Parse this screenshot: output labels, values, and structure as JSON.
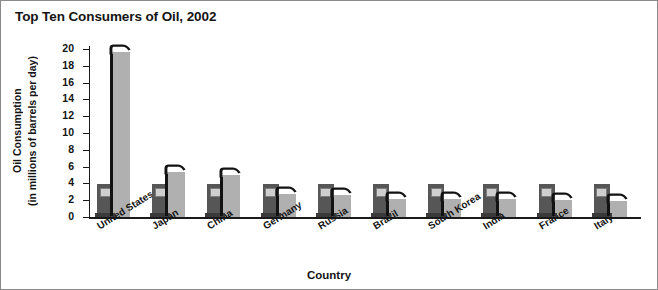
{
  "chart_data": {
    "type": "bar",
    "title": "Top Ten Consumers of Oil, 2002",
    "xlabel": "Country",
    "ylabel": "Oil Consumption (in millions of barrels per day)",
    "ylabel_line1": "Oil Consumption",
    "ylabel_line2": "(in millions of barrels per day)",
    "categories": [
      "United States",
      "Japan",
      "China",
      "Germany",
      "Russia",
      "Brazil",
      "South Korea",
      "India",
      "France",
      "Italy"
    ],
    "values": [
      19.7,
      5.3,
      5.0,
      2.7,
      2.6,
      2.2,
      2.1,
      2.1,
      2.0,
      1.9
    ],
    "ylim": [
      0,
      20
    ],
    "ytick_labels": [
      "0",
      "2",
      "4",
      "6",
      "8",
      "10",
      "12",
      "14",
      "16",
      "18",
      "20"
    ],
    "ytick_values": [
      0,
      2,
      4,
      6,
      8,
      10,
      12,
      14,
      16,
      18,
      20
    ],
    "grid": false,
    "legend": "none",
    "series_name": "Oil consumption",
    "marker_style": "gas-pump",
    "colors": {
      "bar_fill": "#b0b0b0",
      "pump_body": "#565656",
      "pump_base": "#3a3a3a",
      "pump_screen": "#cfcfcf",
      "hose": "#121212",
      "axis": "#1a1a1a",
      "text": "#141414",
      "background": "#ffffff",
      "border": "#8a8a8a"
    }
  }
}
